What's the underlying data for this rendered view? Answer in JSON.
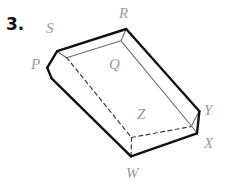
{
  "figure": {
    "problem_number": "3.",
    "shape_name": "open-rectangular-prism",
    "labels": {
      "S": "S",
      "R": "R",
      "P": "P",
      "Q": "Q",
      "Z": "Z",
      "Y": "Y",
      "X": "X",
      "W": "W"
    },
    "colors": {
      "stroke_outer": "#111111",
      "stroke_inner": "#555555",
      "stroke_hidden": "#444444",
      "label_text": "#9a9a9a",
      "number_text": "#111111",
      "background": "#ffffff"
    }
  }
}
